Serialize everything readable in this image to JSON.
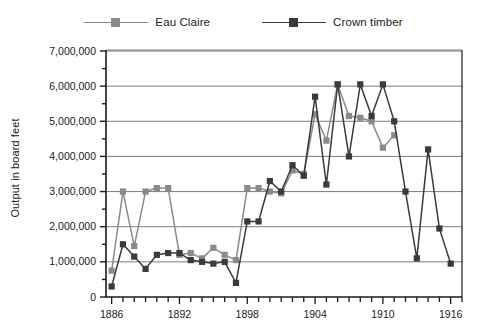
{
  "chart_data": {
    "type": "line",
    "title": "",
    "xlabel": "",
    "ylabel": "Output in board feet",
    "xlim": [
      1885.5,
      1917
    ],
    "ylim": [
      0,
      7000000
    ],
    "grid": true,
    "legend_position": "top-center",
    "y_ticks": [
      "0",
      "1,000,000",
      "2,000,000",
      "3,000,000",
      "4,000,000",
      "5,000,000",
      "6,000,000",
      "7,000,000"
    ],
    "y_tick_values": [
      0,
      1000000,
      2000000,
      3000000,
      4000000,
      5000000,
      6000000,
      7000000
    ],
    "y_minor_tick_values": [
      500000,
      1500000,
      2500000,
      3500000,
      4500000,
      5500000,
      6500000
    ],
    "x_ticks": [
      "1886",
      "1892",
      "1898",
      "1904",
      "1910",
      "1916"
    ],
    "x_tick_values": [
      1886,
      1892,
      1898,
      1904,
      1910,
      1916
    ],
    "x_minor_start": 1886,
    "x_minor_end": 1917,
    "series": [
      {
        "name": "Eau Claire",
        "color": "#8a8a8a",
        "marker": "square",
        "x": [
          1886,
          1887,
          1888,
          1889,
          1890,
          1891,
          1892,
          1893,
          1894,
          1895,
          1896,
          1897,
          1898,
          1899,
          1900,
          1901,
          1902,
          1903,
          1904,
          1905,
          1906,
          1907,
          1908,
          1909,
          1910,
          1911
        ],
        "values": [
          750000,
          3000000,
          1450000,
          3000000,
          3100000,
          3100000,
          1200000,
          1250000,
          1100000,
          1400000,
          1200000,
          1050000,
          3100000,
          3100000,
          3000000,
          2950000,
          3600000,
          3500000,
          5200000,
          4450000,
          6050000,
          5150000,
          5100000,
          5000000,
          4250000,
          4600000
        ]
      },
      {
        "name": "Crown timber",
        "color": "#3a3a3a",
        "marker": "square",
        "x": [
          1886,
          1887,
          1888,
          1889,
          1890,
          1891,
          1892,
          1893,
          1894,
          1895,
          1896,
          1897,
          1898,
          1899,
          1900,
          1901,
          1902,
          1903,
          1904,
          1905,
          1906,
          1907,
          1908,
          1909,
          1910,
          1911,
          1912,
          1913,
          1914,
          1915,
          1916
        ],
        "values": [
          300000,
          1500000,
          1150000,
          800000,
          1200000,
          1250000,
          1250000,
          1050000,
          1000000,
          950000,
          1000000,
          400000,
          2150000,
          2150000,
          3300000,
          3000000,
          3750000,
          3450000,
          5700000,
          3200000,
          6050000,
          4000000,
          6050000,
          5150000,
          6050000,
          5000000,
          3000000,
          1100000,
          4200000,
          1950000,
          950000
        ]
      }
    ]
  },
  "legend": {
    "items": [
      {
        "label": "Eau Claire",
        "color": "#8a8a8a"
      },
      {
        "label": "Crown timber",
        "color": "#3a3a3a"
      }
    ]
  },
  "axis": {
    "y_title": "Output in board feet"
  }
}
